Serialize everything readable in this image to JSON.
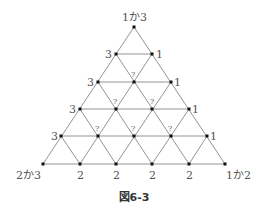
{
  "figure": {
    "caption": "図6-3"
  },
  "vertices": {
    "apex": "1か3",
    "bottom_left": "2か3",
    "bottom_right": "1か2"
  },
  "left_edge_labels": [
    "3",
    "3",
    "3",
    "3"
  ],
  "right_edge_labels": [
    "1",
    "1",
    "1",
    "1"
  ],
  "bottom_edge_labels": [
    "2",
    "2",
    "2",
    "2"
  ],
  "interior_labels": [
    "?",
    "?",
    "?",
    "?",
    "?",
    "?"
  ],
  "colors": {
    "line": "#888888",
    "node": "#111111",
    "text": "#555555"
  }
}
